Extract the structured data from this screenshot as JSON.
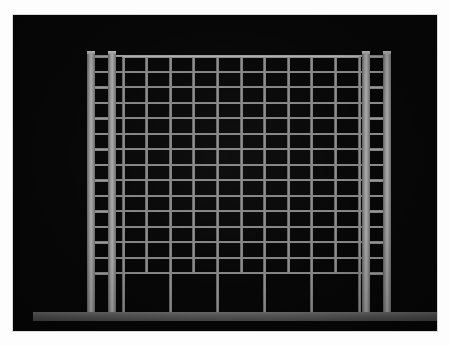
{
  "scene": {
    "title": "Structural frame elevation",
    "background_color": "#ffffff",
    "panel_color": "#070707",
    "member_color": "#9a9a9a",
    "foundation_color": "#5c5c5c",
    "panel": {
      "x": 13,
      "y": 15,
      "width": 424,
      "height": 316
    }
  },
  "structure": {
    "type": "coupled-shear-wall-moment-frame-elevation",
    "storey_count": 15,
    "bay_count": 10,
    "wall_piers_per_side": 2,
    "ground_storey_taller": true,
    "roof_y": 40,
    "base_y": 297,
    "typical_storey_height": 16.2,
    "ground_storey_height": 40,
    "left_wall_x": [
      74,
      95
    ],
    "right_wall_x": [
      349,
      370
    ],
    "wall_pier_width": 8,
    "frame_column_width": 3,
    "beam_thickness": 2,
    "frame_left_x": 110,
    "frame_right_x": 346,
    "ground_column_x": [
      110,
      157,
      204,
      252,
      299,
      346
    ],
    "foundation": {
      "x": 20,
      "y": 297,
      "width": 405,
      "height": 9
    }
  },
  "labels": {
    "panel": "dark photographic panel",
    "left_wall": "left coupled shear wall",
    "right_wall": "right coupled shear wall",
    "frame": "interior moment frame grid",
    "foundation": "foundation grade beam"
  }
}
